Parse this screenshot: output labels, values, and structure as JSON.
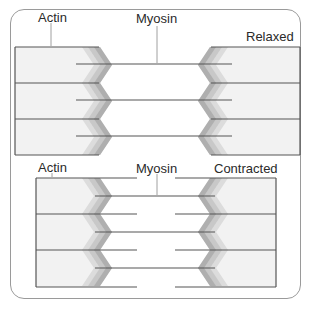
{
  "figure": {
    "relaxed": {
      "state_label": "Relaxed",
      "actin_label": "Actin",
      "myosin_label": "Myosin"
    },
    "contracted": {
      "state_label": "Contracted",
      "actin_label": "Actin",
      "myosin_label": "Myosin"
    }
  },
  "colors": {
    "line": "#555555",
    "band_fill": "#f2f2f2",
    "zigzag_light": "#dcdcdc",
    "zigzag_mid": "#c4c4c4",
    "zigzag_dark": "#a8a8a8",
    "frame": "#9a9a9a"
  }
}
